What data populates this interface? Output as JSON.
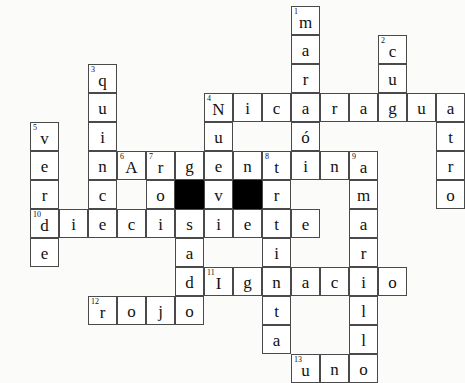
{
  "puzzle": {
    "title": "Spanish crossword puzzle",
    "cell_size": 29,
    "origin": {
      "x": 1,
      "y": 6
    },
    "colors": {
      "page_background": "#fbfbf9",
      "cell_background": "#ffffff",
      "cell_border": "#4a4a4a",
      "block": "#000000",
      "text": "#111111"
    },
    "across_entries": [
      {
        "number": "4",
        "answer": "Nicaragua",
        "row": 3,
        "col": 7
      },
      {
        "number": "6",
        "answer": "Argentina",
        "row": 5,
        "col": 4
      },
      {
        "number": "10",
        "answer": "diecisiete",
        "row": 7,
        "col": 1
      },
      {
        "number": "11",
        "answer": "Ignacio",
        "row": 9,
        "col": 7
      },
      {
        "number": "12",
        "answer": "rojo",
        "row": 10,
        "col": 3
      },
      {
        "number": "13",
        "answer": "uno",
        "row": 12,
        "col": 9
      }
    ],
    "down_entries": [
      {
        "number": "1",
        "answer": "marrón",
        "row": 0,
        "col": 10
      },
      {
        "number": "2",
        "answer": "cuatro",
        "row": 1,
        "col": 13
      },
      {
        "number": "3",
        "answer": "quince",
        "row": 2,
        "col": 3
      },
      {
        "number": "5",
        "answer": "verde",
        "row": 4,
        "col": 1
      },
      {
        "number": "7",
        "answer": "rosado",
        "row": 5,
        "col": 5
      },
      {
        "number": "8",
        "answer": "treinta",
        "row": 5,
        "col": 8
      },
      {
        "number": "9",
        "answer": "amarillo",
        "row": 5,
        "col": 11
      }
    ],
    "cells": [
      {
        "r": 0,
        "c": 10,
        "ch": "m",
        "n": "1"
      },
      {
        "r": 1,
        "c": 10,
        "ch": "a"
      },
      {
        "r": 1,
        "c": 13,
        "ch": "c",
        "n": "2"
      },
      {
        "r": 2,
        "c": 3,
        "ch": "q",
        "n": "3"
      },
      {
        "r": 2,
        "c": 10,
        "ch": "r"
      },
      {
        "r": 2,
        "c": 13,
        "ch": "u"
      },
      {
        "r": 3,
        "c": 3,
        "ch": "u"
      },
      {
        "r": 3,
        "c": 7,
        "ch": "N",
        "n": "4"
      },
      {
        "r": 3,
        "c": 8,
        "ch": "i"
      },
      {
        "r": 3,
        "c": 9,
        "ch": "c"
      },
      {
        "r": 3,
        "c": 10,
        "ch": "a"
      },
      {
        "r": 3,
        "c": 11,
        "ch": "r"
      },
      {
        "r": 3,
        "c": 12,
        "ch": "a"
      },
      {
        "r": 3,
        "c": 13,
        "ch": "g"
      },
      {
        "r": 3,
        "c": 14,
        "ch": "u"
      },
      {
        "r": 3,
        "c": 15,
        "ch": "a"
      },
      {
        "r": 4,
        "c": 1,
        "ch": "v",
        "n": "5"
      },
      {
        "r": 4,
        "c": 3,
        "ch": "i"
      },
      {
        "r": 4,
        "c": 7,
        "ch": "u"
      },
      {
        "r": 4,
        "c": 10,
        "ch": "ó"
      },
      {
        "r": 4,
        "c": 15,
        "ch": "t"
      },
      {
        "r": 5,
        "c": 1,
        "ch": "e"
      },
      {
        "r": 5,
        "c": 3,
        "ch": "n"
      },
      {
        "r": 5,
        "c": 4,
        "ch": "A",
        "n": "6"
      },
      {
        "r": 5,
        "c": 5,
        "ch": "r",
        "n": "7"
      },
      {
        "r": 5,
        "c": 6,
        "ch": "g"
      },
      {
        "r": 5,
        "c": 7,
        "ch": "e"
      },
      {
        "r": 5,
        "c": 8,
        "ch": "n"
      },
      {
        "r": 5,
        "c": 9,
        "ch": "t",
        "n": "8"
      },
      {
        "r": 5,
        "c": 10,
        "ch": "i"
      },
      {
        "r": 5,
        "c": 11,
        "ch": "n"
      },
      {
        "r": 5,
        "c": 12,
        "ch": "a",
        "n": "9"
      },
      {
        "r": 5,
        "c": 15,
        "ch": "r"
      },
      {
        "r": 6,
        "c": 1,
        "ch": "r"
      },
      {
        "r": 6,
        "c": 3,
        "ch": "c"
      },
      {
        "r": 6,
        "c": 5,
        "ch": "o"
      },
      {
        "r": 6,
        "c": 6,
        "ch": "",
        "block": true
      },
      {
        "r": 6,
        "c": 7,
        "ch": "v"
      },
      {
        "r": 6,
        "c": 8,
        "ch": "",
        "block": true
      },
      {
        "r": 6,
        "c": 9,
        "ch": "r"
      },
      {
        "r": 6,
        "c": 12,
        "ch": "m"
      },
      {
        "r": 6,
        "c": 15,
        "ch": "o"
      },
      {
        "r": 7,
        "c": 1,
        "ch": "d",
        "n": "10"
      },
      {
        "r": 7,
        "c": 2,
        "ch": "i"
      },
      {
        "r": 7,
        "c": 3,
        "ch": "e"
      },
      {
        "r": 7,
        "c": 4,
        "ch": "c"
      },
      {
        "r": 7,
        "c": 5,
        "ch": "i"
      },
      {
        "r": 7,
        "c": 6,
        "ch": "s"
      },
      {
        "r": 7,
        "c": 7,
        "ch": "i"
      },
      {
        "r": 7,
        "c": 8,
        "ch": "e"
      },
      {
        "r": 7,
        "c": 9,
        "ch": "t"
      },
      {
        "r": 7,
        "c": 10,
        "ch": "e"
      },
      {
        "r": 7,
        "c": 12,
        "ch": "a"
      },
      {
        "r": 8,
        "c": 1,
        "ch": "e"
      },
      {
        "r": 8,
        "c": 6,
        "ch": "a"
      },
      {
        "r": 8,
        "c": 9,
        "ch": "i"
      },
      {
        "r": 8,
        "c": 12,
        "ch": "r"
      },
      {
        "r": 9,
        "c": 6,
        "ch": "d"
      },
      {
        "r": 9,
        "c": 7,
        "ch": "I",
        "n": "11"
      },
      {
        "r": 9,
        "c": 8,
        "ch": "g"
      },
      {
        "r": 9,
        "c": 9,
        "ch": "n"
      },
      {
        "r": 9,
        "c": 10,
        "ch": "a"
      },
      {
        "r": 9,
        "c": 11,
        "ch": "c"
      },
      {
        "r": 9,
        "c": 12,
        "ch": "i"
      },
      {
        "r": 9,
        "c": 13,
        "ch": "o"
      },
      {
        "r": 10,
        "c": 3,
        "ch": "r",
        "n": "12"
      },
      {
        "r": 10,
        "c": 4,
        "ch": "o"
      },
      {
        "r": 10,
        "c": 5,
        "ch": "j"
      },
      {
        "r": 10,
        "c": 6,
        "ch": "o"
      },
      {
        "r": 10,
        "c": 9,
        "ch": "t"
      },
      {
        "r": 10,
        "c": 12,
        "ch": "l"
      },
      {
        "r": 11,
        "c": 9,
        "ch": "a"
      },
      {
        "r": 11,
        "c": 12,
        "ch": "l"
      },
      {
        "r": 12,
        "c": 10,
        "ch": "u",
        "n": "13"
      },
      {
        "r": 12,
        "c": 11,
        "ch": "n"
      },
      {
        "r": 12,
        "c": 12,
        "ch": "o"
      }
    ]
  }
}
